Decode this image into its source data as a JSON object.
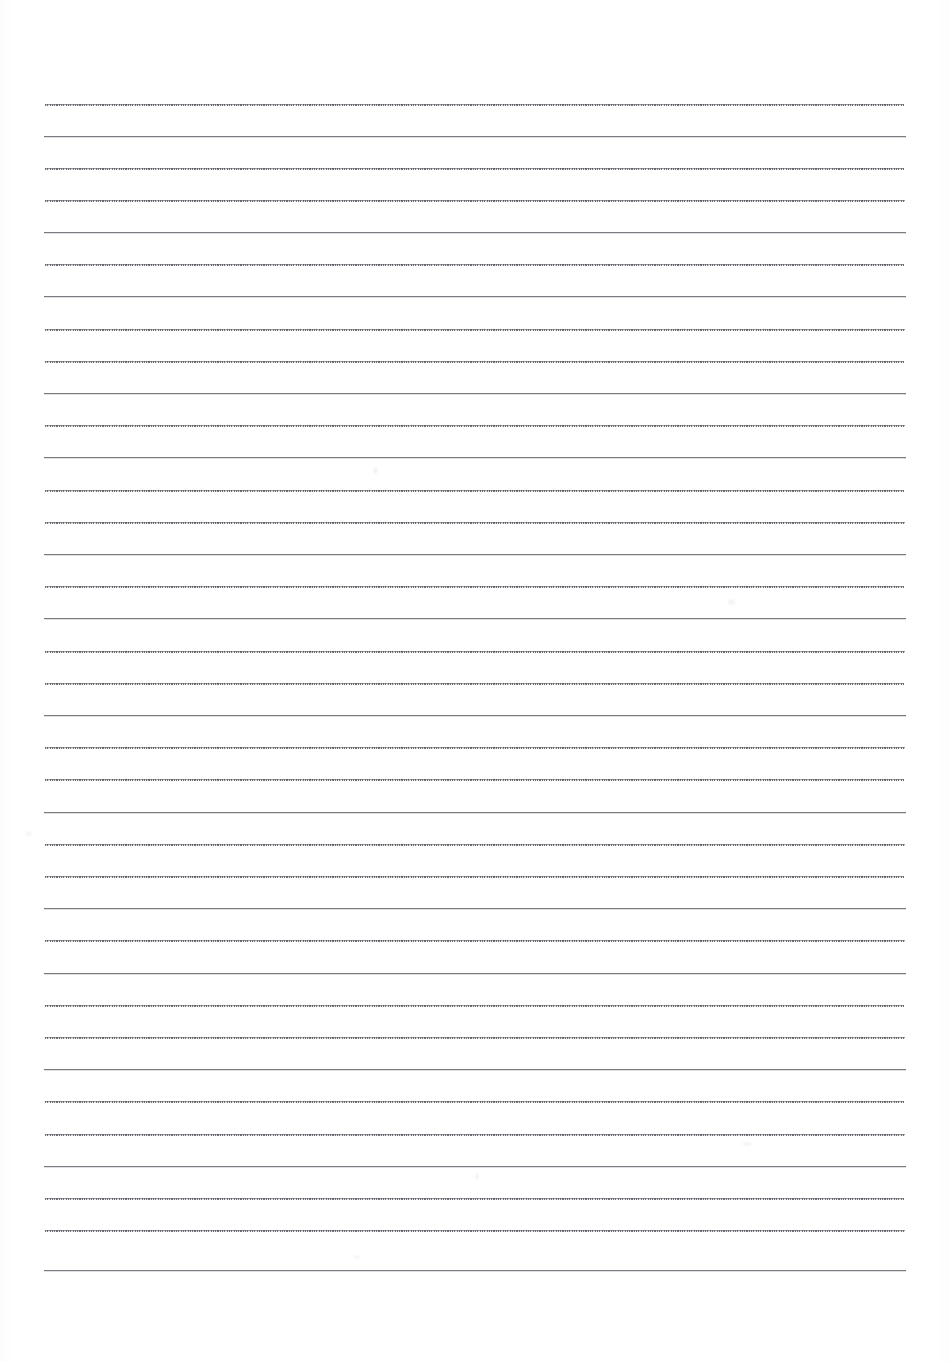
{
  "document": {
    "type": "scanned-blank-ruled-paper",
    "title": "Blank Ruled Paper",
    "content_text": "",
    "has_handwriting": false,
    "page_width": 949,
    "page_height": 1362
  },
  "paper": {
    "background_color": "#ffffff",
    "rule_color": "#8e8f93",
    "rule_color_dark": "#787a7f",
    "rule_color_light": "#9a9ca1",
    "rule_left_x": 44,
    "rule_right_x": 906,
    "rule_line_count": 37,
    "rule_spacing_px": 32.4,
    "first_rule_y": 104,
    "last_rule_y": 1270,
    "margin_top_px": 104,
    "margin_bottom_px": 92,
    "margin_left_px": 44,
    "margin_right_px": 43
  },
  "rules": [
    {
      "y": 104,
      "weight": "light",
      "dotted": true,
      "x1": 45,
      "x2": 904
    },
    {
      "y": 136,
      "weight": "dark",
      "dotted": false,
      "x1": 44,
      "x2": 906
    },
    {
      "y": 168,
      "weight": "light",
      "dotted": true,
      "x1": 45,
      "x2": 904
    },
    {
      "y": 200,
      "weight": "light",
      "dotted": true,
      "x1": 45,
      "x2": 905
    },
    {
      "y": 232,
      "weight": "dark",
      "dotted": false,
      "x1": 44,
      "x2": 906
    },
    {
      "y": 264,
      "weight": "light",
      "dotted": true,
      "x1": 45,
      "x2": 904
    },
    {
      "y": 296,
      "weight": "dark",
      "dotted": false,
      "x1": 44,
      "x2": 906
    },
    {
      "y": 329,
      "weight": "light",
      "dotted": true,
      "x1": 45,
      "x2": 905
    },
    {
      "y": 361,
      "weight": "light",
      "dotted": true,
      "x1": 45,
      "x2": 904
    },
    {
      "y": 393,
      "weight": "dark",
      "dotted": false,
      "x1": 44,
      "x2": 906
    },
    {
      "y": 425,
      "weight": "light",
      "dotted": true,
      "x1": 45,
      "x2": 905
    },
    {
      "y": 457,
      "weight": "dark",
      "dotted": false,
      "x1": 44,
      "x2": 906
    },
    {
      "y": 490,
      "weight": "light",
      "dotted": true,
      "x1": 45,
      "x2": 904
    },
    {
      "y": 522,
      "weight": "light",
      "dotted": true,
      "x1": 45,
      "x2": 905
    },
    {
      "y": 554,
      "weight": "dark",
      "dotted": false,
      "x1": 44,
      "x2": 906
    },
    {
      "y": 586,
      "weight": "light",
      "dotted": true,
      "x1": 45,
      "x2": 904
    },
    {
      "y": 618,
      "weight": "dark",
      "dotted": false,
      "x1": 44,
      "x2": 906
    },
    {
      "y": 651,
      "weight": "light",
      "dotted": true,
      "x1": 45,
      "x2": 905
    },
    {
      "y": 683,
      "weight": "light",
      "dotted": true,
      "x1": 45,
      "x2": 904
    },
    {
      "y": 715,
      "weight": "dark",
      "dotted": false,
      "x1": 44,
      "x2": 906
    },
    {
      "y": 747,
      "weight": "light",
      "dotted": true,
      "x1": 45,
      "x2": 905
    },
    {
      "y": 779,
      "weight": "light",
      "dotted": true,
      "x1": 45,
      "x2": 904
    },
    {
      "y": 812,
      "weight": "dark",
      "dotted": false,
      "x1": 44,
      "x2": 906
    },
    {
      "y": 844,
      "weight": "light",
      "dotted": true,
      "x1": 45,
      "x2": 905
    },
    {
      "y": 876,
      "weight": "light",
      "dotted": true,
      "x1": 45,
      "x2": 904
    },
    {
      "y": 908,
      "weight": "dark",
      "dotted": false,
      "x1": 44,
      "x2": 906
    },
    {
      "y": 940,
      "weight": "light",
      "dotted": true,
      "x1": 45,
      "x2": 905
    },
    {
      "y": 973,
      "weight": "dark",
      "dotted": false,
      "x1": 44,
      "x2": 906
    },
    {
      "y": 1005,
      "weight": "light",
      "dotted": true,
      "x1": 45,
      "x2": 904
    },
    {
      "y": 1037,
      "weight": "light",
      "dotted": true,
      "x1": 45,
      "x2": 905
    },
    {
      "y": 1069,
      "weight": "dark",
      "dotted": false,
      "x1": 44,
      "x2": 906
    },
    {
      "y": 1101,
      "weight": "light",
      "dotted": true,
      "x1": 45,
      "x2": 904
    },
    {
      "y": 1134,
      "weight": "light",
      "dotted": true,
      "x1": 45,
      "x2": 905
    },
    {
      "y": 1166,
      "weight": "dark",
      "dotted": false,
      "x1": 44,
      "x2": 906
    },
    {
      "y": 1198,
      "weight": "light",
      "dotted": true,
      "x1": 45,
      "x2": 904
    },
    {
      "y": 1230,
      "weight": "light",
      "dotted": true,
      "x1": 45,
      "x2": 905
    },
    {
      "y": 1270,
      "weight": "dark",
      "dotted": false,
      "x1": 44,
      "x2": 906
    }
  ],
  "smudges": [
    {
      "x": 372,
      "y": 466,
      "w": 7,
      "h": 9,
      "opacity": 0.1
    },
    {
      "x": 726,
      "y": 598,
      "w": 11,
      "h": 8,
      "opacity": 0.09
    },
    {
      "x": 24,
      "y": 830,
      "w": 9,
      "h": 7,
      "opacity": 0.07
    },
    {
      "x": 740,
      "y": 1141,
      "w": 14,
      "h": 6,
      "opacity": 0.07
    },
    {
      "x": 474,
      "y": 1172,
      "w": 6,
      "h": 9,
      "opacity": 0.09
    },
    {
      "x": 352,
      "y": 1254,
      "w": 10,
      "h": 6,
      "opacity": 0.06
    }
  ]
}
